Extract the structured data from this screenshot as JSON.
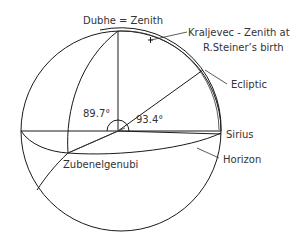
{
  "labels": {
    "zenith": "Dubhe = Zenith",
    "kraljevec_line1": "Kraljevec - Zenith at",
    "kraljevec_line2": "R.Steiner’s birth",
    "ecliptic": "Ecliptic",
    "sirius": "Sirius",
    "horizon": "Horizon",
    "zubenelgenubi": "Zubenelgenubi",
    "angle_left": "89.7°",
    "angle_right": "93.4°"
  },
  "colors": {
    "line": "#1a1a1a",
    "text": "#333333",
    "background": "#ffffff"
  }
}
